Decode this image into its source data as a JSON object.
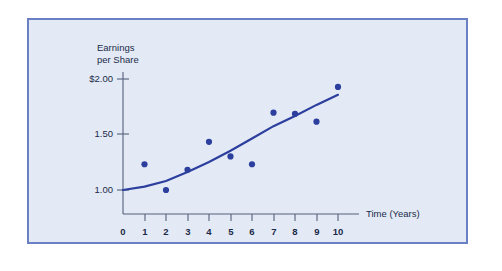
{
  "page": {
    "background_color": "#ffffff"
  },
  "figure": {
    "panel_background": "#e3eaf5",
    "panel_border_color": "#6b7fc4",
    "accent_color": "#2c3f9e",
    "axis_color": "#55607a",
    "text_color": "#1b2a4a"
  },
  "chart_data": {
    "type": "scatter",
    "title": "",
    "subtitle": "",
    "xlabel": "Time (Years)",
    "ylabel": "Earnings per Share",
    "ylabel_lines": [
      "Earnings",
      "per Share"
    ],
    "grid": false,
    "legend": "none",
    "xlim": [
      0,
      10.6
    ],
    "ylim": [
      0.82,
      2.12
    ],
    "x_ticks": [
      0,
      1,
      2,
      3,
      4,
      5,
      6,
      7,
      8,
      9,
      10
    ],
    "x_tick_labels": [
      "0",
      "1",
      "2",
      "3",
      "4",
      "5",
      "6",
      "7",
      "8",
      "9",
      "10"
    ],
    "y_ticks": [
      1.0,
      1.5,
      2.0
    ],
    "y_tick_labels": [
      "1.00",
      "1.50",
      "$2.00"
    ],
    "x": [
      1,
      2,
      3,
      4,
      5,
      6,
      7,
      8,
      9,
      10
    ],
    "values": [
      1.23,
      1.0,
      1.18,
      1.43,
      1.3,
      1.23,
      1.69,
      1.68,
      1.61,
      1.92
    ],
    "series": [
      {
        "name": "Earnings per Share",
        "marker": "circle",
        "color": "#2c3f9e",
        "points": [
          {
            "x": 1,
            "y": 1.23
          },
          {
            "x": 2,
            "y": 1.0
          },
          {
            "x": 3,
            "y": 1.18
          },
          {
            "x": 4,
            "y": 1.43
          },
          {
            "x": 5,
            "y": 1.3
          },
          {
            "x": 6,
            "y": 1.23
          },
          {
            "x": 7,
            "y": 1.69
          },
          {
            "x": 8,
            "y": 1.68
          },
          {
            "x": 9,
            "y": 1.61
          },
          {
            "x": 10,
            "y": 1.92
          }
        ]
      },
      {
        "name": "Trend line",
        "type": "line",
        "color": "#2c3f9e",
        "points": [
          {
            "x": 0,
            "y": 1.0
          },
          {
            "x": 1,
            "y": 1.03
          },
          {
            "x": 2,
            "y": 1.08
          },
          {
            "x": 3,
            "y": 1.16
          },
          {
            "x": 4,
            "y": 1.25
          },
          {
            "x": 5,
            "y": 1.35
          },
          {
            "x": 6,
            "y": 1.46
          },
          {
            "x": 7,
            "y": 1.57
          },
          {
            "x": 8,
            "y": 1.66
          },
          {
            "x": 9,
            "y": 1.76
          },
          {
            "x": 10,
            "y": 1.85
          }
        ]
      }
    ]
  }
}
